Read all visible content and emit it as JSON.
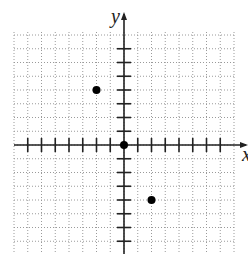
{
  "chart_data": {
    "type": "scatter",
    "title": "",
    "xlabel": "x",
    "ylabel": "y",
    "xlim": [
      -8,
      8
    ],
    "ylim": [
      -8,
      8
    ],
    "grid": true,
    "tick_step": 1,
    "x_ticks": [
      -7,
      -6,
      -5,
      -4,
      -3,
      -2,
      -1,
      1,
      2,
      3,
      4,
      5,
      6,
      7
    ],
    "y_ticks": [
      -7,
      -6,
      -5,
      -4,
      -3,
      -2,
      -1,
      1,
      2,
      3,
      4,
      5,
      6,
      7
    ],
    "points": [
      {
        "x": -2,
        "y": 4
      },
      {
        "x": 0,
        "y": 0
      },
      {
        "x": 2,
        "y": -4
      }
    ]
  },
  "axis_labels": {
    "x": "x",
    "y": "y"
  },
  "colors": {
    "axis": "#222222",
    "grid": "#9a9a9a",
    "point": "#000000"
  }
}
